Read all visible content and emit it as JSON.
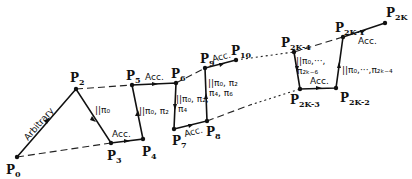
{
  "diagram": {
    "points": [
      {
        "id": "P0",
        "base": "P",
        "sub": "0",
        "x": 17,
        "y": 157
      },
      {
        "id": "P2",
        "base": "P",
        "sub": "2",
        "x": 76,
        "y": 89
      },
      {
        "id": "P3",
        "base": "P",
        "sub": "3",
        "x": 111,
        "y": 143
      },
      {
        "id": "P4",
        "base": "P",
        "sub": "4",
        "x": 143,
        "y": 139
      },
      {
        "id": "P5",
        "base": "P",
        "sub": "5",
        "x": 132,
        "y": 85
      },
      {
        "id": "P6",
        "base": "P",
        "sub": "6",
        "x": 176,
        "y": 83
      },
      {
        "id": "P7",
        "base": "P",
        "sub": "7",
        "x": 174,
        "y": 129
      },
      {
        "id": "P8",
        "base": "P",
        "sub": "8",
        "x": 207,
        "y": 121
      },
      {
        "id": "P9",
        "base": "P",
        "sub": "9",
        "x": 205,
        "y": 68
      },
      {
        "id": "P10",
        "base": "P",
        "sub": "10",
        "x": 236,
        "y": 60
      },
      {
        "id": "P2k-4",
        "base": "P",
        "sub": "2K-4",
        "x": 294,
        "y": 52
      },
      {
        "id": "P2k-3",
        "base": "P",
        "sub": "2K-3",
        "x": 300,
        "y": 89
      },
      {
        "id": "P2k-2",
        "base": "P",
        "sub": "2K-2",
        "x": 336,
        "y": 88
      },
      {
        "id": "P2k-1",
        "base": "P",
        "sub": "2K-1",
        "x": 343,
        "y": 37
      },
      {
        "id": "P2k",
        "base": "P",
        "sub": "2K",
        "x": 385,
        "y": 23
      }
    ],
    "annotations": {
      "arbitrary": "Arbitrary",
      "par_p2p3": "||π₀",
      "acc_p3p4": "Acc.",
      "par_p4p5": "||π₀, π₂",
      "acc_p5p6": "Acc.",
      "par_p6p7_line1": "||π₀, π₂,",
      "par_p6p7_line2": "π₄",
      "acc_p7p8": "Acc.",
      "par_p8p9_line1": "||π₀, π₂",
      "par_p8p9_line2": "π₄, π₆",
      "acc_p9p10": "Acc.",
      "par_p2k4_line1": "||π₀,···,",
      "par_p2k4_line2": "π₂ₖ₋₆",
      "acc_p2k3": "Acc.",
      "par_p2k2": "||π₀,···,π₂ₖ₋₄",
      "acc_p2k1": "Acc."
    }
  }
}
